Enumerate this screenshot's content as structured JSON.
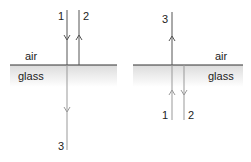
{
  "left_panel": {
    "top_medium": "air",
    "bottom_medium": "glass",
    "rays": [
      {
        "label": "1",
        "direction": "down",
        "role": "incident"
      },
      {
        "label": "2",
        "direction": "up",
        "role": "reflected"
      },
      {
        "label": "3",
        "direction": "down",
        "role": "transmitted"
      }
    ]
  },
  "right_panel": {
    "top_medium": "air",
    "bottom_medium": "glass",
    "rays": [
      {
        "label": "1",
        "direction": "up",
        "role": "incident"
      },
      {
        "label": "2",
        "direction": "down",
        "role": "reflected"
      },
      {
        "label": "3",
        "direction": "up",
        "role": "transmitted"
      }
    ]
  },
  "colors": {
    "ray_air": "#555555",
    "ray_glass": "#999999",
    "surface": "#333333",
    "glass_top": "#dddddd"
  }
}
